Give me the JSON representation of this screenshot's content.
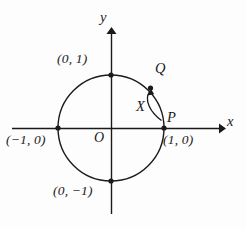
{
  "figure": {
    "background_color": "#fdfdfd",
    "stroke_color": "#1a1a1a"
  },
  "axes": {
    "x_label": "x",
    "y_label": "y",
    "origin_label": "O"
  },
  "circle": {
    "center": [
      111,
      128
    ],
    "radius": 53,
    "description": "unit circle"
  },
  "points": [
    {
      "name": "top",
      "label": "(0, 1)",
      "coords": [
        0,
        1
      ],
      "px": [
        111,
        75
      ]
    },
    {
      "name": "left",
      "label": "(−1, 0)",
      "coords": [
        -1,
        0
      ],
      "px": [
        58,
        128
      ]
    },
    {
      "name": "right",
      "label": "(1, 0)",
      "coords": [
        1,
        0
      ],
      "px": [
        164,
        128
      ]
    },
    {
      "name": "bottom",
      "label": "(0, −1)",
      "coords": [
        0,
        -1
      ],
      "px": [
        111,
        181
      ]
    }
  ],
  "markers": {
    "p_label": "P",
    "q_label": "Q",
    "x_label": "X"
  },
  "arc_arrow": {
    "from": "P",
    "to": "Q",
    "direction": "counterclockwise",
    "angle_label": "X"
  }
}
